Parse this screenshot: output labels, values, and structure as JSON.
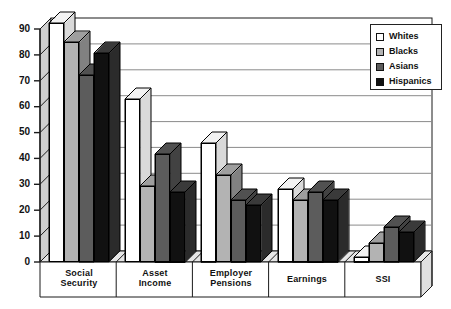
{
  "chart_data": {
    "type": "bar",
    "title": "",
    "xlabel": "",
    "ylabel": "",
    "ylim": [
      0,
      90
    ],
    "ytick_step": 10,
    "yticks": [
      "0",
      "10",
      "20",
      "30",
      "40",
      "50",
      "60",
      "70",
      "80",
      "90"
    ],
    "grid": true,
    "legend_position": "top-right",
    "style": "3d-grouped-bars",
    "categories": [
      "Social Security",
      "Asset Income",
      "Employer Pensions",
      "Earnings",
      "SSI"
    ],
    "category_lines": [
      [
        "Social",
        "Security"
      ],
      [
        "Asset",
        "Income"
      ],
      [
        "Employer",
        "Pensions"
      ],
      [
        "Earnings"
      ],
      [
        "SSI"
      ]
    ],
    "series": [
      {
        "name": "Whites",
        "color": "#ffffff",
        "values": [
          88,
          60,
          44,
          27,
          2
        ]
      },
      {
        "name": "Blacks",
        "color": "#b3b3b3",
        "values": [
          81,
          28,
          32,
          23,
          7
        ]
      },
      {
        "name": "Asians",
        "color": "#5c5c5c",
        "values": [
          69,
          40,
          23,
          26,
          13
        ]
      },
      {
        "name": "Hispanics",
        "color": "#111111",
        "values": [
          77,
          26,
          21,
          23,
          11
        ]
      }
    ]
  },
  "legend": {
    "entries": [
      {
        "label": "Whites",
        "swatch": "#ffffff"
      },
      {
        "label": "Blacks",
        "swatch": "#b3b3b3"
      },
      {
        "label": "Asians",
        "swatch": "#5c5c5c"
      },
      {
        "label": "Hispanics",
        "swatch": "#111111"
      }
    ]
  },
  "colors": {
    "axis": "#1a1a1a",
    "gridline": "#888888",
    "wall_fill": "#cfcfcf",
    "floor_fill": "#ffffff",
    "bar_white": "#ffffff",
    "bar_light_gray": "#b3b3b3",
    "bar_dark_gray": "#5c5c5c",
    "bar_black": "#111111"
  }
}
